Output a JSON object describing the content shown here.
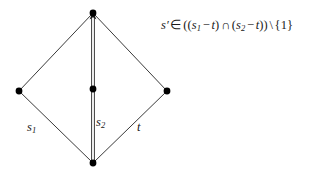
{
  "figure": {
    "type": "lattice-diamond-diagram",
    "background_color": "#ffffff",
    "stroke_color": "#3a3a3a",
    "node_color": "#000000",
    "width": 309,
    "height": 178,
    "nodes": [
      {
        "id": "top",
        "name": "top-vertex",
        "x": 93,
        "y": 13,
        "r": 3.4
      },
      {
        "id": "left",
        "name": "left-vertex",
        "x": 19,
        "y": 91,
        "r": 3.4
      },
      {
        "id": "middle",
        "name": "middle-vertex",
        "x": 93,
        "y": 89,
        "r": 3.4
      },
      {
        "id": "right",
        "name": "right-vertex",
        "x": 167,
        "y": 91,
        "r": 3.4
      },
      {
        "id": "bottom",
        "name": "bottom-vertex",
        "x": 93,
        "y": 163,
        "r": 3.4
      }
    ],
    "edges": [
      {
        "id": "left-upper",
        "name": "edge-left-upper",
        "from": "left",
        "to": "top",
        "style": "single"
      },
      {
        "id": "left-lower",
        "name": "edge-left-lower",
        "from": "bottom",
        "to": "left",
        "style": "single"
      },
      {
        "id": "right-upper",
        "name": "edge-right-upper",
        "from": "right",
        "to": "top",
        "style": "single"
      },
      {
        "id": "right-lower",
        "name": "edge-right-lower",
        "from": "bottom",
        "to": "right",
        "style": "single"
      },
      {
        "id": "vertical",
        "name": "edge-vertical",
        "from": "bottom",
        "to": "top",
        "style": "double",
        "arrow": "up"
      }
    ],
    "labels": {
      "s1": {
        "text": "s",
        "sub": "1"
      },
      "s2": {
        "text": "s",
        "sub": "2"
      },
      "t": {
        "text": "t"
      }
    },
    "formula": {
      "full_text": "s′ ∈ ((s₁ − t) ∩ (s₂ − t)) \\ {1}",
      "parts": {
        "var": "s",
        "prime": "′",
        "member": "∈",
        "open2": "((",
        "s1_base": "s",
        "s1_sub": "1",
        "minus1": "−",
        "t1": "t",
        "close1": ")",
        "cap": "∩",
        "open1": "(",
        "s2_base": "s",
        "s2_sub": "2",
        "minus2": "−",
        "t2": "t",
        "close2": "))",
        "setminus": "\\",
        "braceopen": "{",
        "one": "1",
        "braceclose": "}"
      }
    }
  }
}
